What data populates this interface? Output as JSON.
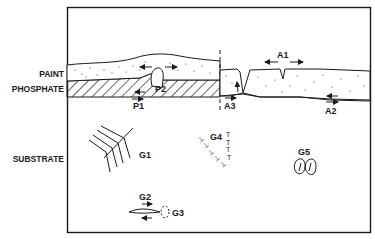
{
  "figure": {
    "type": "schematic cross-section",
    "layer_labels": {
      "paint": "PAINT",
      "phosphate": "PHOSPHATE",
      "substrate": "SUBSTRATE"
    },
    "markers": {
      "p1": "P1",
      "p2": "P2",
      "a1": "A1",
      "a2": "A2",
      "a3": "A3",
      "g1": "G1",
      "g2": "G2",
      "g3": "G3",
      "g4": "G4",
      "g5": "G5"
    },
    "colors": {
      "ink": "#1a1a1a",
      "background": "#ffffff"
    }
  }
}
